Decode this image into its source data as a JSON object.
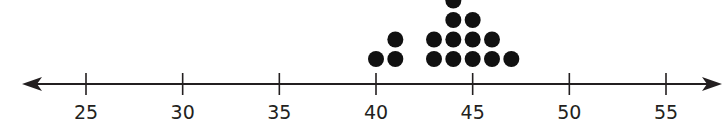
{
  "chart_data": {
    "type": "dot-plot",
    "title": "",
    "xlabel": "",
    "ylabel": "",
    "x_ticks": [
      25,
      30,
      35,
      40,
      45,
      50,
      55
    ],
    "xlim": [
      21.5,
      57.5
    ],
    "grid": false,
    "legend": null,
    "values": [
      40,
      41,
      41,
      43,
      43,
      44,
      44,
      44,
      44,
      45,
      45,
      45,
      46,
      46,
      47
    ],
    "counts": [
      {
        "x": 40,
        "count": 1
      },
      {
        "x": 41,
        "count": 2
      },
      {
        "x": 43,
        "count": 2
      },
      {
        "x": 44,
        "count": 4
      },
      {
        "x": 45,
        "count": 3
      },
      {
        "x": 46,
        "count": 2
      },
      {
        "x": 47,
        "count": 1
      }
    ],
    "axis_arrows": "both",
    "colors": {
      "dot": "#111111",
      "axis": "#231f20",
      "label": "#231f20"
    }
  },
  "axis": {
    "tick_labels": [
      "25",
      "30",
      "35",
      "40",
      "45",
      "50",
      "55"
    ]
  }
}
